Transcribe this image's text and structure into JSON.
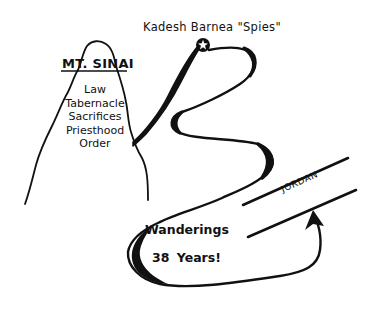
{
  "diagram": {
    "locations": {
      "kadesh": {
        "label": "Kadesh  Barnea  \"Spies\"",
        "marker": "star-icon"
      },
      "sinai": {
        "title": "MT. SINAI",
        "items": [
          "Law",
          "Tabernacle",
          "Sacrifices",
          "Priesthood",
          "Order"
        ]
      },
      "wanderings": {
        "line1": "Wanderings",
        "line2": "38  Years!"
      },
      "jordan": {
        "label": "JORDAN"
      }
    },
    "colors": {
      "ink": "#111111",
      "background": "#ffffff"
    }
  }
}
